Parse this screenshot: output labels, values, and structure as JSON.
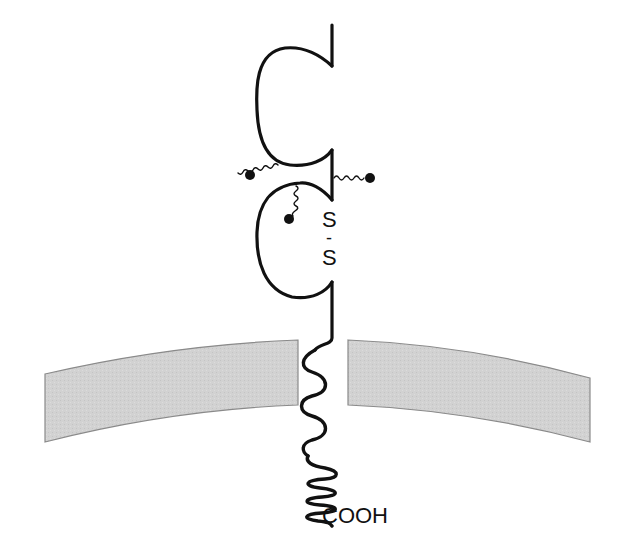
{
  "diagram": {
    "type": "membrane-receptor-schematic",
    "labels": {
      "disulfide_top": "S",
      "disulfide_dash": "-",
      "disulfide_bottom": "S",
      "c_terminus": "COOH"
    },
    "colors": {
      "line": "#111111",
      "membrane_fill": "#d4d4d4",
      "membrane_edge": "#8a8a8a",
      "background": "#ffffff"
    },
    "elements": [
      {
        "name": "extracellular-domain-1",
        "shape": "C-shaped loop"
      },
      {
        "name": "extracellular-domain-2",
        "shape": "C-shaped loop with S-S bond"
      },
      {
        "name": "glycosylation-chains",
        "count": 3
      },
      {
        "name": "transmembrane-segment",
        "shape": "wavy line through membrane"
      },
      {
        "name": "cytoplasmic-tail",
        "shape": "coiled segment ending in COOH"
      },
      {
        "name": "cell-membrane",
        "shape": "curved gray bilayer band, split by receptor"
      }
    ]
  }
}
